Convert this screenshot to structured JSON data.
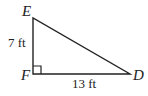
{
  "figure": {
    "type": "right-triangle",
    "vertices": {
      "E": {
        "label": "E",
        "x": 33,
        "y": 18
      },
      "F": {
        "label": "F",
        "x": 33,
        "y": 74
      },
      "D": {
        "label": "D",
        "x": 130,
        "y": 74
      }
    },
    "right_angle_at": "F",
    "sides": {
      "EF": {
        "label": "7 ft"
      },
      "FD": {
        "label": "13 ft"
      }
    },
    "stroke_color": "#222222"
  }
}
